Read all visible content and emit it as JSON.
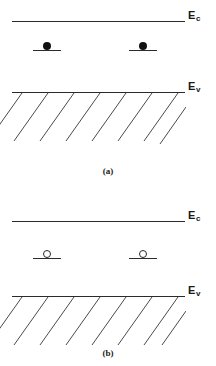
{
  "figure": {
    "background_color": "#ffffff",
    "line_color": "#2b2b2b",
    "carrier_fill_color": "#111111"
  },
  "panels": [
    {
      "id": "a",
      "caption": "(a)",
      "conduction_band": {
        "label_base": "E",
        "label_sub": "c",
        "label_full": "E c"
      },
      "valence_band": {
        "label_base": "E",
        "label_sub": "v",
        "label_full": "E v"
      },
      "trap_levels": [
        {
          "carrier": "electron",
          "symbol": "filled-dot"
        },
        {
          "carrier": "electron",
          "symbol": "filled-dot"
        }
      ]
    },
    {
      "id": "b",
      "caption": "(b)",
      "conduction_band": {
        "label_base": "E",
        "label_sub": "c",
        "label_full": "E c"
      },
      "valence_band": {
        "label_base": "E",
        "label_sub": "v",
        "label_full": "E v"
      },
      "trap_levels": [
        {
          "carrier": "hole",
          "symbol": "open-circle"
        },
        {
          "carrier": "hole",
          "symbol": "open-circle"
        }
      ]
    }
  ]
}
